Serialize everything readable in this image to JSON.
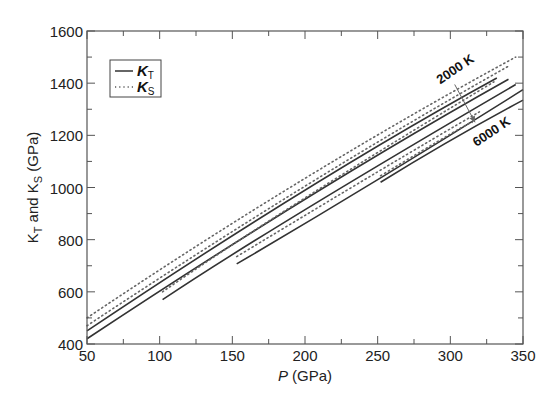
{
  "chart_data": {
    "type": "line",
    "title": "",
    "xlabel": "P (GPa)",
    "xlabel_italic_part": "P",
    "xlabel_rest": " (GPa)",
    "ylabel": "K_T and K_S (GPa)",
    "ylabel_parts": [
      "K",
      "T",
      " and K",
      "S",
      " (GPa)"
    ],
    "xlim": [
      50,
      350
    ],
    "ylim": [
      400,
      1600
    ],
    "xticks": [
      50,
      100,
      150,
      200,
      250,
      300,
      350
    ],
    "yticks": [
      400,
      600,
      800,
      1000,
      1200,
      1400,
      1600
    ],
    "x_minor_step": 25,
    "y_minor_step": 100,
    "grid": false,
    "legend": {
      "position": "top-left",
      "entries": [
        {
          "label": "K",
          "sub": "T",
          "style": "solid"
        },
        {
          "label": "K",
          "sub": "S",
          "style": "dotted"
        }
      ]
    },
    "annotations": [
      {
        "text": "2000 K",
        "at": [
          305,
          1440
        ]
      },
      {
        "text": "6000 K",
        "at": [
          330,
          1200
        ]
      }
    ],
    "arrow": {
      "from": [
        303,
        1395
      ],
      "to": [
        317,
        1250
      ]
    },
    "series": [
      {
        "name": "K_T 2000 K",
        "style": "solid",
        "points": [
          [
            50,
            450
          ],
          [
            200,
            990
          ],
          [
            332,
            1420
          ]
        ]
      },
      {
        "name": "K_T 3000 K",
        "style": "solid",
        "points": [
          [
            50,
            420
          ],
          [
            200,
            955
          ],
          [
            340,
            1415
          ]
        ]
      },
      {
        "name": "K_T 4000 K",
        "style": "solid",
        "points": [
          [
            102,
            570
          ],
          [
            200,
            915
          ],
          [
            345,
            1395
          ]
        ]
      },
      {
        "name": "K_T 5000 K",
        "style": "solid",
        "points": [
          [
            153,
            707
          ],
          [
            250,
            1030
          ],
          [
            350,
            1375
          ]
        ]
      },
      {
        "name": "K_T 6000 K",
        "style": "solid",
        "points": [
          [
            252,
            1020
          ],
          [
            300,
            1180
          ],
          [
            350,
            1335
          ]
        ]
      },
      {
        "name": "K_S 2000 K",
        "style": "dotted",
        "points": [
          [
            50,
            500
          ],
          [
            200,
            1035
          ],
          [
            345,
            1500
          ]
        ]
      },
      {
        "name": "K_S 3000 K",
        "style": "dotted",
        "points": [
          [
            50,
            470
          ],
          [
            200,
            1005
          ],
          [
            340,
            1465
          ]
        ]
      },
      {
        "name": "K_S 4000 K",
        "style": "dotted",
        "points": [
          [
            102,
            600
          ],
          [
            200,
            960
          ],
          [
            330,
            1405
          ]
        ]
      },
      {
        "name": "K_S 5000 K",
        "style": "dotted",
        "points": [
          [
            153,
            735
          ],
          [
            250,
            1060
          ],
          [
            320,
            1290
          ]
        ]
      },
      {
        "name": "K_S 6000 K",
        "style": "dotted",
        "points": [
          [
            252,
            1045
          ],
          [
            300,
            1205
          ],
          [
            315,
            1250
          ]
        ]
      }
    ]
  }
}
